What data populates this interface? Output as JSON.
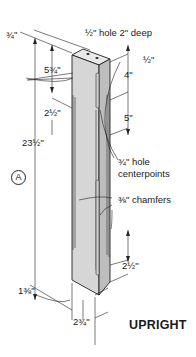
{
  "title": "UPRIGHT",
  "part_callout": "A",
  "dimensions": {
    "top_thickness": "¾\"",
    "hole": "½\" hole 2\" deep",
    "top_offset": "½\"",
    "upper_spacing": "4\"",
    "mid_spacing": "5\"",
    "chamfer_start": "5¾\"",
    "left_inset": "2½\"",
    "overall_height": "23½\"",
    "hole_centerpoints": "¾\" hole centerpoints",
    "chamfers": "⅜\" chamfers",
    "bottom_offset": "2½\"",
    "width_thin": "1⅜\"",
    "width_wide": "2¾\""
  },
  "colors": {
    "line": "#222222",
    "face_front": "#d6d6d6",
    "face_side": "#bdbdbd",
    "face_top": "#e8e8e8"
  }
}
